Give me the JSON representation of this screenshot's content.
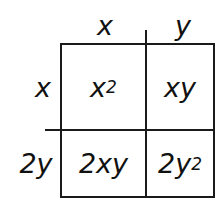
{
  "diagram": {
    "type": "area-model-multiplication",
    "column_headers": [
      "x",
      "y"
    ],
    "row_headers": [
      "x",
      "2y"
    ],
    "cells": [
      [
        {
          "base": "x",
          "exp": "2"
        },
        {
          "base": "xy",
          "exp": ""
        }
      ],
      [
        {
          "base": "2xy",
          "exp": ""
        },
        {
          "base": "2y",
          "exp": "2"
        }
      ]
    ]
  }
}
